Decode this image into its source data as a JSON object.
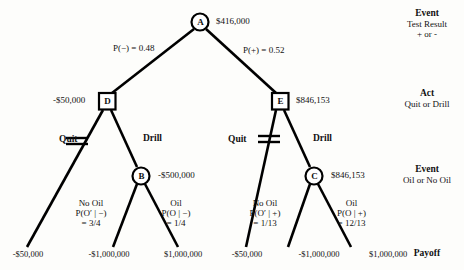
{
  "diagram": {
    "type": "decision-tree",
    "nodes": {
      "A": {
        "letter": "A",
        "shape": "circle",
        "kind": "chance",
        "value": "$416,000",
        "x": 200,
        "y": 22
      },
      "D": {
        "letter": "D",
        "shape": "square",
        "kind": "decision",
        "value": "-$50,000",
        "x": 107,
        "y": 101
      },
      "E": {
        "letter": "E",
        "shape": "square",
        "kind": "decision",
        "value": "$846,153",
        "x": 280,
        "y": 101
      },
      "B": {
        "letter": "B",
        "shape": "circle",
        "kind": "chance",
        "value": "-$500,000",
        "x": 141,
        "y": 176
      },
      "C": {
        "letter": "C",
        "shape": "circle",
        "kind": "chance",
        "value": "$846,153",
        "x": 314,
        "y": 176
      }
    },
    "branches": {
      "test_negative": "P(−) = 0.48",
      "test_positive": "P(+) = 0.52",
      "quit_left": "Quit",
      "drill_left": "Drill",
      "quit_right": "Quit",
      "drill_right": "Drill",
      "no_oil_left_name": "No Oil",
      "no_oil_left_p": "P(O′ | −)",
      "no_oil_left_v": "= 3/4",
      "oil_left_name": "Oil",
      "oil_left_p": "P(O | −)",
      "oil_left_v": "= 1/4",
      "no_oil_right_name": "No Oil",
      "no_oil_right_p": "P(O′ | +)",
      "no_oil_right_v": "= 1/13",
      "oil_right_name": "Oil",
      "oil_right_p": "P(O | +)",
      "oil_right_v": "= 12/13"
    },
    "payoffs": [
      "-$50,000",
      "-$1,000,000",
      "$1,000,000",
      "-$50,000",
      "-$1,000,000",
      "$1,000,000"
    ],
    "stage_labels": [
      {
        "head": "Event",
        "sub1": "Test Result",
        "sub2": "+ or -"
      },
      {
        "head": "Act",
        "sub1": "Quit or Drill",
        "sub2": ""
      },
      {
        "head": "Event",
        "sub1": "Oil or No Oil",
        "sub2": ""
      },
      {
        "head": "Payoff",
        "sub1": "",
        "sub2": ""
      }
    ],
    "colors": {
      "line": "#000000",
      "text": "#111111",
      "background": "#fdfdfb"
    }
  }
}
